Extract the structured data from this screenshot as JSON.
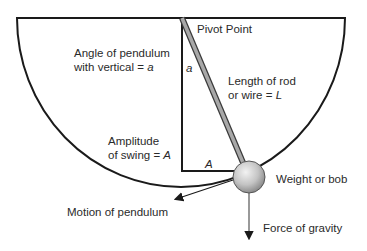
{
  "labels": {
    "pivot": "Pivot Point",
    "angle_line1": "Angle of pendulum",
    "angle_line2_prefix": "with vertical = ",
    "angle_var": "a",
    "angle_marker": "a",
    "length_line1": "Length of rod",
    "length_line2_prefix": "or wire = ",
    "length_var": "L",
    "amplitude_line1": "Amplitude",
    "amplitude_line2_prefix": "of swing = ",
    "amplitude_var": "A",
    "amplitude_marker": "A",
    "bob": "Weight or bob",
    "motion": "Motion of pendulum",
    "gravity": "Force of gravity"
  },
  "colors": {
    "outline": "#1a1a1a",
    "rod": "#a8a8a8",
    "bob_light": "#e6e6e6",
    "bob_dark": "#8c8c8c",
    "arrow": "#333333"
  }
}
